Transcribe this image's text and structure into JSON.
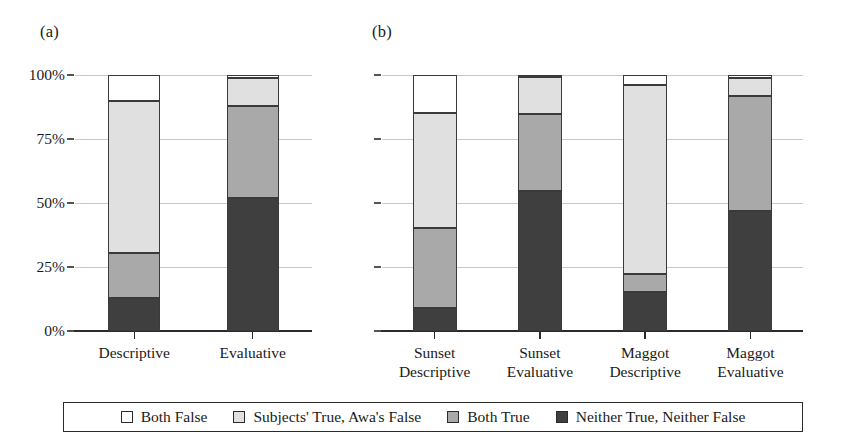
{
  "figure": {
    "panels": [
      {
        "id": "a",
        "label": "(a)"
      },
      {
        "id": "b",
        "label": "(b)"
      }
    ]
  },
  "legend": {
    "items": [
      {
        "label": "Both False",
        "color": "#ffffff"
      },
      {
        "label": "Subjects' True, Awa's False",
        "color": "#e0e0e0"
      },
      {
        "label": "Both True",
        "color": "#a9a9a9"
      },
      {
        "label": "Neither True, Neither False",
        "color": "#3f3f3f"
      }
    ]
  },
  "axis": {
    "ticks": [
      "100%",
      "75%",
      "50%",
      "25%",
      "0%"
    ],
    "tick_values": [
      100,
      75,
      50,
      25,
      0
    ]
  },
  "chart_data": [
    {
      "type": "bar",
      "panel": "a",
      "title": "(a)",
      "stacked": true,
      "normalized": true,
      "xlabel": "",
      "ylabel": "",
      "ylim": [
        0,
        100
      ],
      "ytick_labels": [
        "0%",
        "25%",
        "50%",
        "75%",
        "100%"
      ],
      "grid": true,
      "legend_position": "bottom",
      "categories": [
        "Descriptive",
        "Evaluative"
      ],
      "series": [
        {
          "name": "Neither True, Neither False",
          "color": "#3f3f3f",
          "values": [
            12.9,
            52.1
          ]
        },
        {
          "name": "Both True",
          "color": "#a9a9a9",
          "values": [
            17.6,
            35.9
          ]
        },
        {
          "name": "Subjects' True, Awa's False",
          "color": "#e0e0e0",
          "values": [
            59.3,
            11.0
          ]
        },
        {
          "name": "Both False",
          "color": "#ffffff",
          "values": [
            10.2,
            1.0
          ]
        }
      ]
    },
    {
      "type": "bar",
      "panel": "b",
      "title": "(b)",
      "stacked": true,
      "normalized": true,
      "xlabel": "",
      "ylabel": "",
      "ylim": [
        0,
        100
      ],
      "ytick_labels": [
        "0%",
        "25%",
        "50%",
        "75%",
        "100%"
      ],
      "grid": true,
      "legend_position": "bottom",
      "categories": [
        "Sunset\nDescriptive",
        "Sunset\nEvaluative",
        "Maggot\nDescriptive",
        "Maggot\nEvaluative"
      ],
      "series": [
        {
          "name": "Neither True, Neither False",
          "color": "#3f3f3f",
          "values": [
            9.1,
            54.8,
            15.1,
            46.9
          ]
        },
        {
          "name": "Both True",
          "color": "#a9a9a9",
          "values": [
            31.0,
            30.0,
            7.0,
            44.9
          ]
        },
        {
          "name": "Subjects' True, Awa's False",
          "color": "#e0e0e0",
          "values": [
            45.2,
            14.3,
            74.0,
            6.9
          ]
        },
        {
          "name": "Both False",
          "color": "#ffffff",
          "values": [
            14.7,
            0.9,
            3.9,
            1.3
          ]
        }
      ]
    }
  ]
}
